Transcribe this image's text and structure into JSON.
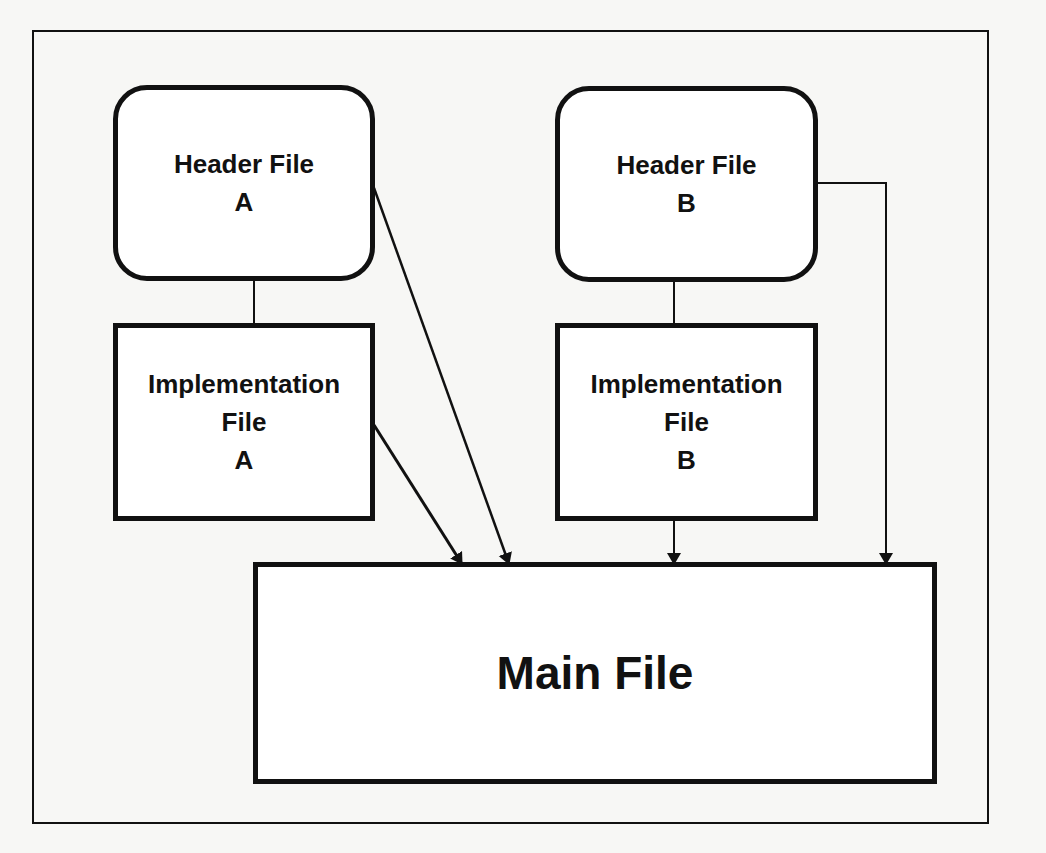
{
  "diagram": {
    "type": "file-dependency",
    "nodes": [
      {
        "id": "header_a",
        "shape": "rounded-rect",
        "lines": [
          "Header File",
          "A"
        ]
      },
      {
        "id": "header_b",
        "shape": "rounded-rect",
        "lines": [
          "Header File",
          "B"
        ]
      },
      {
        "id": "impl_a",
        "shape": "rect",
        "lines": [
          "Implementation",
          "File",
          "A"
        ]
      },
      {
        "id": "impl_b",
        "shape": "rect",
        "lines": [
          "Implementation",
          "File",
          "B"
        ]
      },
      {
        "id": "main",
        "shape": "rect",
        "lines": [
          "Main File"
        ]
      }
    ],
    "edges": [
      {
        "from": "header_a",
        "to": "impl_a",
        "arrow": false
      },
      {
        "from": "header_b",
        "to": "impl_b",
        "arrow": false
      },
      {
        "from": "header_a",
        "to": "main",
        "arrow": true
      },
      {
        "from": "impl_a",
        "to": "main",
        "arrow": true
      },
      {
        "from": "impl_b",
        "to": "main",
        "arrow": true
      },
      {
        "from": "header_b",
        "to": "main",
        "arrow": true
      }
    ],
    "colors": {
      "stroke": "#111111",
      "background": "#f7f7f5",
      "box_fill": "#ffffff"
    }
  }
}
